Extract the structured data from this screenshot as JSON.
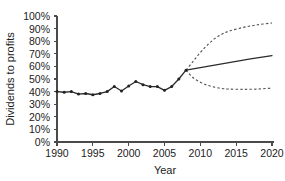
{
  "chart_data": {
    "type": "line",
    "title": "",
    "xlabel": "Year",
    "ylabel": "Dividends to profits",
    "xlim": [
      1990,
      2020
    ],
    "ylim": [
      0,
      100
    ],
    "grid": false,
    "legend_position": "none",
    "y_unit": "%",
    "x_ticks": [
      1990,
      1995,
      2000,
      2005,
      2010,
      2015,
      2020
    ],
    "x_tick_labels": [
      "1990",
      "1995",
      "2000",
      "2005",
      "2010",
      "2015",
      "2020"
    ],
    "y_ticks": [
      0,
      10,
      20,
      30,
      40,
      50,
      60,
      70,
      80,
      90,
      100
    ],
    "y_tick_labels": [
      "0%",
      "10%",
      "20%",
      "30%",
      "40%",
      "50%",
      "60%",
      "70%",
      "80%",
      "90%",
      "100%"
    ],
    "forecast_start_year": 2008,
    "forecast_start_value": 57,
    "series": [
      {
        "name": "Historical dividends to profits",
        "style": "solid-with-markers",
        "x": [
          1990,
          1991,
          1992,
          1993,
          1994,
          1995,
          1996,
          1997,
          1998,
          1999,
          2000,
          2001,
          2002,
          2003,
          2004,
          2005,
          2006,
          2007,
          2008
        ],
        "values": [
          40,
          39.5,
          40,
          38,
          38.5,
          37.5,
          38.5,
          40,
          44,
          40.5,
          44.5,
          48,
          45.5,
          44,
          44,
          41,
          44,
          50,
          57
        ]
      },
      {
        "name": "Central projection",
        "style": "solid",
        "x": [
          2008,
          2011,
          2014,
          2017,
          2020
        ],
        "values": [
          57,
          60,
          63,
          66,
          68.5
        ]
      },
      {
        "name": "Upper projection",
        "style": "dashed",
        "x": [
          2008,
          2009,
          2010,
          2011,
          2012,
          2013,
          2014,
          2016,
          2018,
          2020
        ],
        "values": [
          57,
          64,
          71,
          77,
          82,
          85.5,
          88,
          91,
          93,
          94.5
        ]
      },
      {
        "name": "Lower projection",
        "style": "dashed",
        "x": [
          2008,
          2009,
          2010,
          2011,
          2012,
          2013,
          2014,
          2016,
          2018,
          2020
        ],
        "values": [
          57,
          51,
          47.5,
          45,
          43.5,
          42.5,
          42,
          41.8,
          42,
          42.8
        ]
      }
    ]
  },
  "colors": {
    "background": "#ffffff",
    "axis": "#4a4a4a",
    "historical_line": "#2b2b2b",
    "central_line": "#2b2b2b",
    "band_line": "#4f4f4f",
    "text": "#1c1c1c"
  }
}
